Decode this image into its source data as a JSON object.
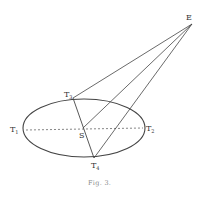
{
  "figure": {
    "caption": "Fig. 3.",
    "colors": {
      "line": "#444444",
      "dashed": "#666666",
      "text": "#333333",
      "caption": "#888888"
    },
    "points": {
      "E": {
        "label": "E",
        "sub": ""
      },
      "S": {
        "label": "S",
        "sub": ""
      },
      "T1": {
        "label": "T",
        "sub": "1"
      },
      "T2": {
        "label": "T",
        "sub": "2"
      },
      "T3": {
        "label": "T",
        "sub": "3"
      },
      "T4": {
        "label": "T",
        "sub": "4"
      }
    }
  }
}
